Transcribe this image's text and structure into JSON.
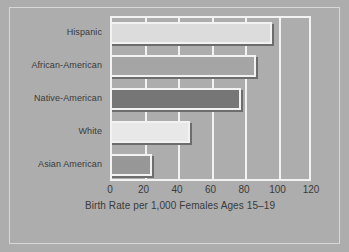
{
  "chart_data": {
    "type": "bar",
    "orientation": "horizontal",
    "title": "",
    "xlabel": "Birth Rate per 1,000 Females Ages 15–19",
    "ylabel": "",
    "categories": [
      "Hispanic",
      "African-American",
      "Native-American",
      "White",
      "Asian American"
    ],
    "values": [
      97,
      87,
      78,
      48,
      25
    ],
    "xlim": [
      0,
      120
    ],
    "xticks": [
      0,
      20,
      40,
      60,
      80,
      100,
      120
    ],
    "xtick_labels": [
      "0",
      "20",
      "40",
      "60",
      "80",
      "100",
      "120"
    ],
    "grid": true,
    "grid_color": "#f2f2f2",
    "legend": "none",
    "background_color": "#adadad",
    "bar_colors": [
      "#dcdcdc",
      "#a5a5a5",
      "#767676",
      "#e8e8e8",
      "#979797"
    ],
    "bar_edge_color": "#f2f2f2",
    "bar_shadow_color": "#6d6d6d",
    "text_color": "#3a3a3a"
  }
}
